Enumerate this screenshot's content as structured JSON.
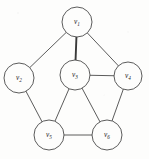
{
  "figure": {
    "kind": "undirected-graph-diagram",
    "background_color": "#fdfdfc",
    "stroke_color": "#4a4a4a",
    "label_color": "#1c1c1c"
  },
  "chart_data": {
    "type": "diagram",
    "title": "",
    "xlabel": "",
    "ylabel": "",
    "graph_type": "undirected",
    "node_count": 6,
    "edge_count": 9,
    "nodes": [
      {
        "id": "v1",
        "label": "v",
        "subscript": "1",
        "cx": 77,
        "cy": 22,
        "r": 15
      },
      {
        "id": "v2",
        "label": "v",
        "subscript": "2",
        "cx": 19,
        "cy": 78,
        "r": 15
      },
      {
        "id": "v3",
        "label": "v",
        "subscript": "3",
        "cx": 75,
        "cy": 75,
        "r": 15
      },
      {
        "id": "v4",
        "label": "v",
        "subscript": "4",
        "cx": 128,
        "cy": 76,
        "r": 14
      },
      {
        "id": "v5",
        "label": "v",
        "subscript": "5",
        "cx": 49,
        "cy": 135,
        "r": 15
      },
      {
        "id": "v6",
        "label": "v",
        "subscript": "6",
        "cx": 107,
        "cy": 135,
        "r": 15
      }
    ],
    "edges": [
      {
        "from": "v1",
        "to": "v2",
        "emphasis": false
      },
      {
        "from": "v1",
        "to": "v3",
        "emphasis": true
      },
      {
        "from": "v1",
        "to": "v4",
        "emphasis": false
      },
      {
        "from": "v3",
        "to": "v4",
        "emphasis": false
      },
      {
        "from": "v2",
        "to": "v5",
        "emphasis": false
      },
      {
        "from": "v3",
        "to": "v5",
        "emphasis": false
      },
      {
        "from": "v3",
        "to": "v6",
        "emphasis": false
      },
      {
        "from": "v5",
        "to": "v6",
        "emphasis": false
      },
      {
        "from": "v4",
        "to": "v6",
        "emphasis": false
      }
    ]
  }
}
